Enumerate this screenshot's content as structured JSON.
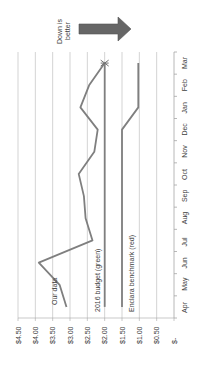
{
  "chart_data": {
    "type": "line",
    "title": "",
    "orientation": "rotated -90deg (months run bottom-to-top, dollar axis runs right-to-left)",
    "xlabel": "",
    "ylabel": "",
    "categories": [
      "Apr",
      "May",
      "Jun",
      "Jul",
      "Aug",
      "Sep",
      "Oct",
      "Nov",
      "Dec",
      "Jan",
      "Feb",
      "Mar"
    ],
    "y_ticks": [
      "$-",
      "$0.50",
      "$1.00",
      "$1.50",
      "$2.00",
      "$2.50",
      "$3.00",
      "$3.50",
      "$4.00",
      "$4.50"
    ],
    "ylim": [
      0,
      4.5
    ],
    "grid": true,
    "series": [
      {
        "name": "Our data",
        "color": "#7f7f7f",
        "values": [
          3.1,
          3.3,
          3.9,
          2.35,
          2.55,
          2.6,
          2.75,
          2.3,
          2.2,
          2.7,
          2.45,
          2.0
        ]
      },
      {
        "name": "2016 budget (green)",
        "color": "#808080",
        "values": [
          2.0,
          2.0,
          2.0,
          2.0,
          2.0,
          2.0,
          2.0,
          2.0,
          2.0,
          2.0,
          2.0,
          2.0
        ]
      },
      {
        "name": "Enclara benchmark (red)",
        "color": "#6f6f6f",
        "values": [
          1.5,
          1.5,
          1.5,
          1.5,
          1.5,
          1.5,
          1.5,
          1.5,
          1.5,
          1.03,
          1.03,
          1.03
        ]
      }
    ],
    "annotations": [
      {
        "text": "Our data",
        "near": "Apr-May, Our data series"
      },
      {
        "text": "2016 budget (green)",
        "near": "Apr-Jul, budget series"
      },
      {
        "text": "Enclara benchmark (red)",
        "near": "Apr-Jul, benchmark series"
      },
      {
        "text": "Down is better",
        "with_arrow": true,
        "arrow_direction": "toward lower values"
      }
    ]
  },
  "labels": {
    "our_data": "Our data",
    "budget": "2016 budget (green)",
    "benchmark": "Enclara benchmark (red)",
    "down_is_better_line1": "Down is",
    "down_is_better_line2": "better"
  },
  "axis": {
    "y_ticks": [
      "$4.50",
      "$4.00",
      "$3.50",
      "$3.00",
      "$2.50",
      "$2.00",
      "$1.50",
      "$1.00",
      "$0.50",
      "$-"
    ],
    "months": [
      "Apr",
      "May",
      "Jun",
      "Jul",
      "Aug",
      "Sep",
      "Oct",
      "Nov",
      "Dec",
      "Jan",
      "Feb",
      "Mar"
    ]
  },
  "colors": {
    "gridline": "#c8c8c8",
    "axis": "#a6a6a6",
    "series_line": "#7f7f7f",
    "arrow_fill": "#666666",
    "text": "#404040"
  }
}
